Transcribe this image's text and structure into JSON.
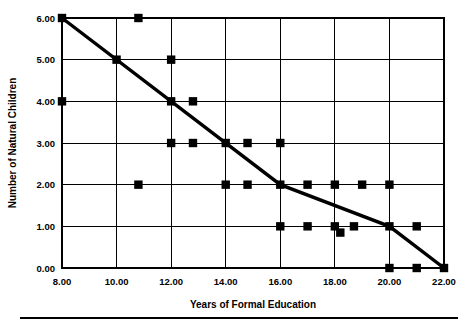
{
  "chart_data": {
    "type": "scatter",
    "title": "",
    "xlabel": "Years of Formal Education",
    "ylabel": "Number of Natural Children",
    "xlim": [
      8,
      22
    ],
    "ylim": [
      0,
      6
    ],
    "grid": true,
    "legend": "none",
    "xticks": [
      8,
      10,
      12,
      14,
      16,
      18,
      20,
      22
    ],
    "yticks": [
      0,
      1,
      2,
      3,
      4,
      5,
      6
    ],
    "xtick_labels": [
      "8.00",
      "10.00",
      "12.00",
      "14.00",
      "16.00",
      "18.00",
      "20.00",
      "22.00"
    ],
    "ytick_labels": [
      "0.00",
      "1.00",
      "2.00",
      "3.00",
      "4.00",
      "5.00",
      "6.00"
    ],
    "marker_style": "filled-square",
    "marker_color": "#000000",
    "points": [
      {
        "x": 8.0,
        "y": 6.0
      },
      {
        "x": 8.0,
        "y": 4.0
      },
      {
        "x": 10.0,
        "y": 5.0
      },
      {
        "x": 10.8,
        "y": 6.0
      },
      {
        "x": 10.8,
        "y": 2.0
      },
      {
        "x": 12.0,
        "y": 5.0
      },
      {
        "x": 12.0,
        "y": 4.0
      },
      {
        "x": 12.0,
        "y": 3.0
      },
      {
        "x": 12.8,
        "y": 4.0
      },
      {
        "x": 12.8,
        "y": 3.0
      },
      {
        "x": 14.0,
        "y": 3.0
      },
      {
        "x": 14.0,
        "y": 2.0
      },
      {
        "x": 14.8,
        "y": 3.0
      },
      {
        "x": 14.8,
        "y": 2.0
      },
      {
        "x": 16.0,
        "y": 3.0
      },
      {
        "x": 16.0,
        "y": 2.0
      },
      {
        "x": 16.0,
        "y": 1.0
      },
      {
        "x": 17.0,
        "y": 2.0
      },
      {
        "x": 17.0,
        "y": 1.0
      },
      {
        "x": 18.0,
        "y": 2.0
      },
      {
        "x": 18.0,
        "y": 1.0
      },
      {
        "x": 18.2,
        "y": 0.85
      },
      {
        "x": 18.7,
        "y": 1.0
      },
      {
        "x": 19.0,
        "y": 2.0
      },
      {
        "x": 20.0,
        "y": 2.0
      },
      {
        "x": 20.0,
        "y": 1.0
      },
      {
        "x": 20.0,
        "y": 0.0
      },
      {
        "x": 21.0,
        "y": 1.0
      },
      {
        "x": 21.0,
        "y": 0.0
      },
      {
        "x": 22.0,
        "y": 0.0
      }
    ],
    "trend_line": {
      "name": "fitted-trend",
      "color": "#000000",
      "vertices": [
        {
          "x": 8.0,
          "y": 6.0
        },
        {
          "x": 16.0,
          "y": 2.0
        },
        {
          "x": 20.0,
          "y": 1.0
        },
        {
          "x": 22.0,
          "y": 0.0
        }
      ]
    }
  },
  "footer": {
    "rule": "horizontal-rule"
  }
}
